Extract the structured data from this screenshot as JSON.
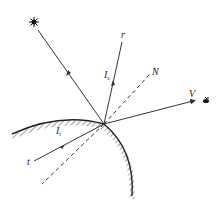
{
  "diagram": {
    "type": "light reflection and transmission at curved surface",
    "labels": {
      "reflected_ray": "r",
      "specular_intensity": "I",
      "specular_sub": "s",
      "normal": "N",
      "view": "V",
      "transmitted_intensity": "I",
      "transmitted_sub": "t",
      "transmitted_ray": "t"
    },
    "icons": {
      "light_source": "sun-icon",
      "viewer": "eye-icon"
    },
    "colors": {
      "stroke": "#333333",
      "background": "#ffffff"
    }
  }
}
